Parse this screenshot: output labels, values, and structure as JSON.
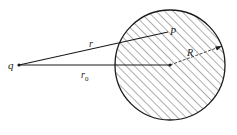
{
  "diagram": {
    "labels": {
      "charge": "q",
      "point": "P",
      "distance_to_point": "r",
      "distance_to_center": "r",
      "distance_to_center_sub": "0",
      "radius": "R"
    },
    "colors": {
      "stroke": "#1a1a1a",
      "hatch": "#333333",
      "background": "#ffffff"
    }
  }
}
